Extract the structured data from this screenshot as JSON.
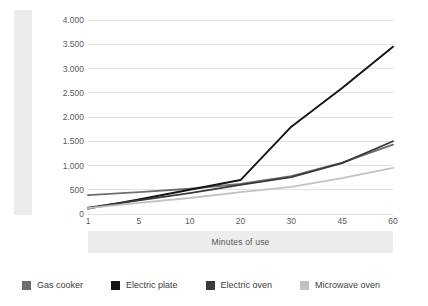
{
  "chart_data": {
    "type": "line",
    "title": "",
    "xlabel": "Minutes of use",
    "ylabel": "Grams of CO2 eq",
    "ylabel_parts": {
      "pre": "Grams of CO",
      "sub": "2",
      "post": " eq"
    },
    "categories": [
      "1",
      "5",
      "10",
      "20",
      "30",
      "45",
      "60"
    ],
    "x": [
      1,
      5,
      10,
      20,
      30,
      45,
      60
    ],
    "ylim": [
      0,
      4000
    ],
    "ytick_values": [
      0,
      500,
      1000,
      1500,
      2000,
      2500,
      3000,
      3500,
      4000
    ],
    "ytick_labels": [
      "0",
      "500",
      "1.000",
      "1.500",
      "2.000",
      "2.500",
      "3.000",
      "3.500",
      "4.000"
    ],
    "grid": true,
    "legend_position": "bottom",
    "series": [
      {
        "name": "Gas cooker",
        "color": "#6e6e6e",
        "values": [
          390,
          450,
          520,
          620,
          780,
          1060,
          1430
        ]
      },
      {
        "name": "Electric plate",
        "color": "#141414",
        "values": [
          110,
          300,
          500,
          700,
          1800,
          2600,
          3450
        ]
      },
      {
        "name": "Electric oven",
        "color": "#3a3a3a",
        "values": [
          130,
          280,
          430,
          600,
          760,
          1050,
          1500
        ]
      },
      {
        "name": "Microwave oven",
        "color": "#c2c2c2",
        "values": [
          120,
          230,
          330,
          450,
          560,
          740,
          950
        ]
      }
    ]
  },
  "legend": {
    "items": [
      {
        "label": "Gas cooker",
        "color": "#6e6e6e"
      },
      {
        "label": "Electric plate",
        "color": "#141414"
      },
      {
        "label": "Electric oven",
        "color": "#3a3a3a"
      },
      {
        "label": "Microwave oven",
        "color": "#c2c2c2"
      }
    ]
  },
  "style": {
    "background": "#ffffff",
    "band_color": "#ececec",
    "grid_color": "#e3e3e3",
    "tick_text_color": "#5a5a5a",
    "axis_title_color": "#555555"
  }
}
